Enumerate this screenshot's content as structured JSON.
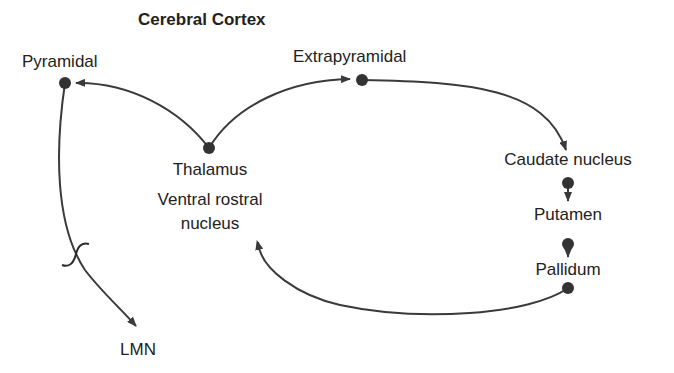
{
  "diagram": {
    "title": "Cerebral Cortex",
    "colors": {
      "line": "#3a3a3a",
      "node": "#333333",
      "text": "#222222",
      "background": "#ffffff"
    },
    "nodes": [
      {
        "id": "pyramidal",
        "label": "Pyramidal"
      },
      {
        "id": "extrapyramidal",
        "label": "Extrapyramidal"
      },
      {
        "id": "thalamus",
        "label": "Thalamus"
      },
      {
        "id": "ventral_rostral",
        "label_line1": "Ventral rostral",
        "label_line2": "nucleus"
      },
      {
        "id": "caudate",
        "label": "Caudate nucleus"
      },
      {
        "id": "putamen",
        "label": "Putamen"
      },
      {
        "id": "pallidum",
        "label": "Pallidum"
      },
      {
        "id": "lmn",
        "label": "LMN"
      }
    ],
    "edges": [
      {
        "from": "thalamus",
        "to": "pyramidal"
      },
      {
        "from": "thalamus",
        "to": "extrapyramidal"
      },
      {
        "from": "extrapyramidal",
        "to": "caudate"
      },
      {
        "from": "caudate",
        "to": "putamen"
      },
      {
        "from": "putamen",
        "to": "pallidum"
      },
      {
        "from": "pallidum",
        "to": "ventral_rostral"
      },
      {
        "from": "pyramidal",
        "to": "lmn",
        "annotation": "crossing (decussation) mark"
      }
    ]
  }
}
